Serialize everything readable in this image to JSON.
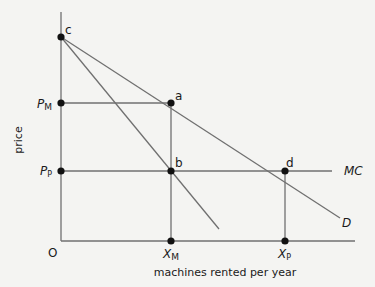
{
  "diagram": {
    "type": "economics-monopoly-pricing",
    "axes": {
      "y_label": "price",
      "x_label": "machines rented per year",
      "origin_label": "O"
    },
    "price_labels": {
      "pm": "P",
      "pm_sub": "M",
      "pp": "P",
      "pp_sub": "P"
    },
    "quantity_labels": {
      "xm": "X",
      "xm_sub": "M",
      "xp": "X",
      "xp_sub": "P"
    },
    "points": {
      "c": "c",
      "a": "a",
      "b": "b",
      "d": "d"
    },
    "curves": {
      "mc": "MC",
      "d": "D"
    },
    "colors": {
      "line": "#707070",
      "dot": "#111111",
      "background": "#f4f4f2"
    }
  }
}
